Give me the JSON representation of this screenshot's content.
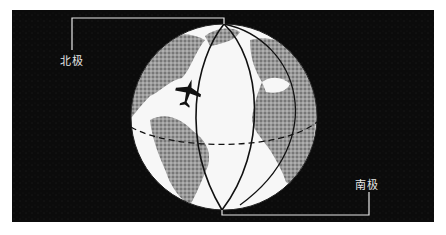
{
  "figure": {
    "labels": {
      "north_pole": "北极",
      "south_pole": "南极"
    },
    "colors": {
      "background": "#0b0b0b",
      "globe_ocean": "#f7f7f7",
      "land": "#8a8a8a",
      "lines": "#111111",
      "leader_lines": "#e8e8e8"
    }
  }
}
